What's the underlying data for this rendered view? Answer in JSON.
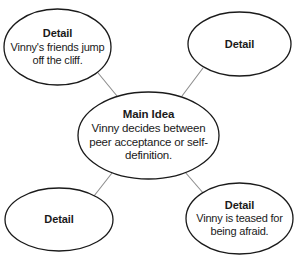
{
  "diagram": {
    "type": "main-idea-and-details-web",
    "colors": {
      "ellipse_stroke": "#1a1a1a",
      "connector_stroke": "#8d8d8d",
      "background": "#ffffff",
      "text": "#1a1a1a"
    },
    "center": {
      "title": "Main Idea",
      "body": "Vinny decides between peer acceptance or self-definition."
    },
    "details": [
      {
        "title": "Detail",
        "body": "Vinny's friends jump off the cliff."
      },
      {
        "title": "Detail",
        "body": ""
      },
      {
        "title": "Detail",
        "body": ""
      },
      {
        "title": "Detail",
        "body": "Vinny is teased for being afraid."
      }
    ]
  }
}
